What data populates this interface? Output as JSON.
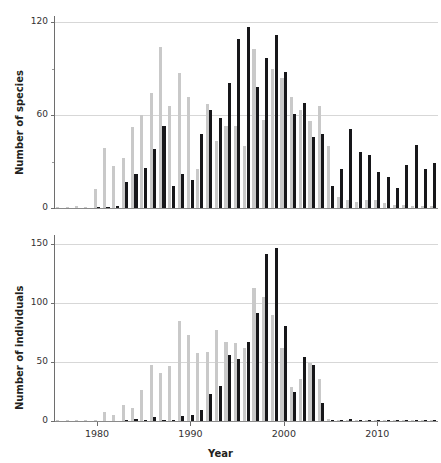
{
  "chart_data": [
    {
      "id": "species",
      "type": "bar",
      "title": "",
      "xlabel": "",
      "ylabel": "Number of species",
      "xlim": [
        1975.5,
        2016.5
      ],
      "ylim": [
        0,
        124
      ],
      "yticks": [
        0,
        60,
        120
      ],
      "ytick_labels": [
        "0",
        "60",
        "120"
      ],
      "yminor_ticks": [
        30,
        90
      ],
      "xticks": [
        1980,
        1990,
        2000,
        2010
      ],
      "xtick_labels": [
        "1980",
        "1990",
        "2000",
        "2010"
      ],
      "grid": true,
      "legend": "none",
      "categories": [
        1976,
        1977,
        1978,
        1979,
        1980,
        1981,
        1982,
        1983,
        1984,
        1985,
        1986,
        1987,
        1988,
        1989,
        1990,
        1991,
        1992,
        1993,
        1994,
        1995,
        1996,
        1997,
        1998,
        1999,
        2000,
        2001,
        2002,
        2003,
        2004,
        2005,
        2006,
        2007,
        2008,
        2009,
        2010,
        2011,
        2012,
        2013,
        2014,
        2015,
        2016
      ],
      "series": [
        {
          "name": "gray",
          "color": "#c9c9c9",
          "values": [
            0.6,
            0.8,
            1,
            0.8,
            12,
            39,
            27,
            32,
            52,
            60,
            74,
            104,
            66,
            87,
            72,
            25,
            67,
            43,
            53,
            53,
            40,
            103,
            57,
            90,
            84,
            72,
            63,
            56,
            66,
            40,
            7,
            5,
            4,
            5,
            5,
            3,
            2,
            2,
            1,
            1,
            1
          ]
        },
        {
          "name": "black",
          "color": "#17171a",
          "values": [
            0,
            0,
            0,
            0,
            0.5,
            0.8,
            1,
            17,
            22,
            26,
            38,
            53,
            14,
            22,
            18,
            48,
            63,
            58,
            81,
            109,
            117,
            78,
            97,
            112,
            88,
            61,
            68,
            46,
            48,
            14,
            25,
            51,
            36,
            34,
            23,
            20,
            13,
            28,
            41,
            25,
            29
          ]
        }
      ]
    },
    {
      "id": "individuals",
      "type": "bar",
      "title": "",
      "xlabel": "Year",
      "ylabel": "Number of individuals",
      "xlim": [
        1975.5,
        2016.5
      ],
      "ylim": [
        0,
        158
      ],
      "yticks": [
        0,
        50,
        100,
        150
      ],
      "ytick_labels": [
        "0",
        "50",
        "100",
        "150"
      ],
      "xticks": [
        1980,
        1990,
        2000,
        2010
      ],
      "xtick_labels": [
        "1980",
        "1990",
        "2000",
        "2010"
      ],
      "grid": true,
      "legend": "none",
      "categories": [
        1976,
        1977,
        1978,
        1979,
        1980,
        1981,
        1982,
        1983,
        1984,
        1985,
        1986,
        1987,
        1988,
        1989,
        1990,
        1991,
        1992,
        1993,
        1994,
        1995,
        1996,
        1997,
        1998,
        1999,
        2000,
        2001,
        2002,
        2003,
        2004,
        2005,
        2006,
        2007,
        2008,
        2009,
        2010,
        2011,
        2012,
        2013,
        2014,
        2015,
        2016
      ],
      "series": [
        {
          "name": "gray",
          "color": "#c9c9c9",
          "values": [
            0.5,
            0.5,
            0.5,
            0.5,
            1,
            8,
            5,
            14,
            11,
            26,
            48,
            41,
            47,
            85,
            73,
            58,
            59,
            77,
            67,
            66,
            62,
            113,
            105,
            90,
            62,
            29,
            36,
            49,
            36,
            2,
            1,
            1,
            1,
            1,
            1,
            0.5,
            0.5,
            0.5,
            0.5,
            0.5,
            0.5
          ]
        },
        {
          "name": "black",
          "color": "#17171a",
          "values": [
            0,
            0,
            0,
            0,
            0,
            0,
            0,
            1,
            2,
            1,
            3,
            1,
            1,
            4,
            5,
            9,
            23,
            30,
            56,
            53,
            67,
            92,
            142,
            147,
            81,
            25,
            54,
            48,
            15,
            0.5,
            0.5,
            2,
            0.5,
            0.5,
            0.5,
            0.5,
            0.5,
            0.5,
            0.5,
            0.5,
            0.5
          ]
        }
      ]
    }
  ],
  "labels": {
    "y_species": "Number of species",
    "y_individuals": "Number of individuals",
    "x_axis": "Year"
  }
}
